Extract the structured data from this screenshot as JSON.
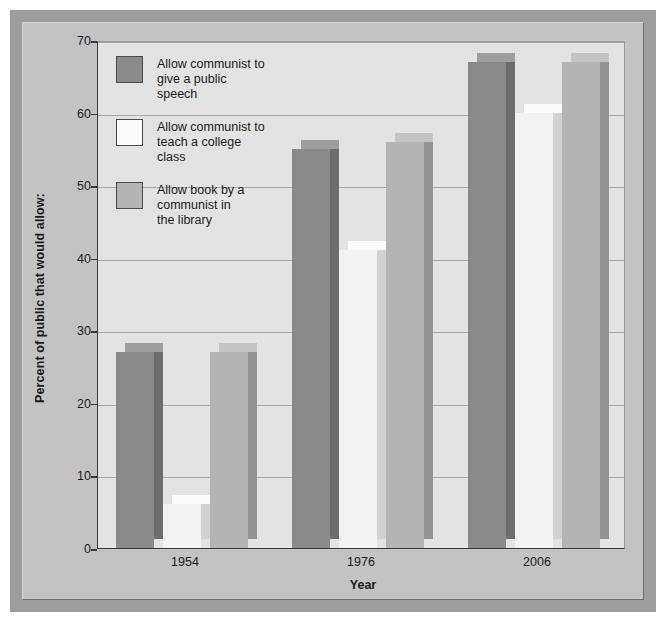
{
  "figure": {
    "frame_color": "#9d9d9d",
    "background_color": "#c3c3c3",
    "plot_background_color": "#e3e3e3"
  },
  "chart_data": {
    "type": "bar",
    "title": "",
    "subtitle": "",
    "xlabel": "Year",
    "ylabel": "Percent of public that would allow:",
    "categories": [
      "1954",
      "1976",
      "2006"
    ],
    "ylim": [
      0,
      70
    ],
    "yticks": [
      0,
      10,
      20,
      30,
      40,
      50,
      60,
      70
    ],
    "ytick_labels": [
      "0",
      "10",
      "20",
      "30",
      "40",
      "50",
      "60",
      "70"
    ],
    "grid": true,
    "legend_position": "top-left inside plot",
    "series": [
      {
        "name": "Allow communist to give a public speech",
        "color": "#8a8a8a",
        "side_color": "#6d6d6d",
        "top_color": "#9e9e9e",
        "values": [
          27,
          55,
          67
        ]
      },
      {
        "name": "Allow communist to teach a college class",
        "color": "#f2f2f2",
        "side_color": "#d2d2d2",
        "top_color": "#fbfbfb",
        "values": [
          6,
          41,
          60
        ]
      },
      {
        "name": "Allow book by a communist in the library",
        "color": "#b4b4b4",
        "side_color": "#949494",
        "top_color": "#c4c4c4",
        "values": [
          27,
          56,
          67
        ]
      }
    ]
  },
  "legend": {
    "items": [
      {
        "label": "Allow communist to\ngive a public\nspeech",
        "swatch_color": "#8a8a8a"
      },
      {
        "label": "Allow communist to\nteach a college\nclass",
        "swatch_color": "#fbfbfb"
      },
      {
        "label": "Allow book by a\ncommunist in\nthe library",
        "swatch_color": "#b4b4b4"
      }
    ]
  }
}
